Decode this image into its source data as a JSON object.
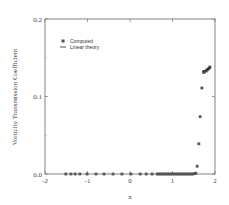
{
  "chart_data": {
    "type": "scatter",
    "title": "",
    "xlabel": "x",
    "ylabel": "Vorticity Transmission Coefficient",
    "xlim": [
      -2,
      2
    ],
    "ylim": [
      0.0,
      0.2
    ],
    "xticks": [
      -2,
      -1,
      0,
      1,
      2
    ],
    "xtick_labels": [
      "-2",
      "-1",
      "0",
      "1",
      "2"
    ],
    "yticks": [
      0.0,
      0.1,
      0.2
    ],
    "ytick_labels": [
      "0.0",
      "0.1",
      "0.2"
    ],
    "grid": false,
    "legend_position": "upper left",
    "series": [
      {
        "name": "Computed",
        "marker": "square",
        "color": "#555555",
        "x": [
          -1.51,
          -1.39,
          -1.29,
          -1.18,
          -1.01,
          -0.8,
          -0.61,
          -0.4,
          -0.19,
          0.02,
          0.24,
          0.38,
          0.52,
          0.64,
          0.68,
          0.72,
          0.76,
          0.8,
          0.84,
          0.88,
          0.92,
          0.96,
          1.0,
          1.04,
          1.08,
          1.12,
          1.16,
          1.2,
          1.24,
          1.28,
          1.32,
          1.36,
          1.4,
          1.44,
          1.48,
          1.52,
          1.55,
          1.58,
          1.62,
          1.65,
          1.69,
          1.73,
          1.76,
          1.79,
          1.81,
          1.83,
          1.85,
          1.87,
          1.88
        ],
        "y": [
          0,
          0,
          0,
          0,
          0,
          0,
          0,
          0,
          0,
          0,
          0,
          0,
          0,
          0,
          0,
          0,
          0,
          0,
          0,
          0,
          0,
          0,
          0,
          0,
          0,
          0,
          0,
          0,
          0,
          0,
          0,
          0,
          0,
          0,
          0,
          0.0005,
          0.001,
          0.01,
          0.039,
          0.074,
          0.111,
          0.131,
          0.132,
          0.133,
          0.134,
          0.135,
          0.136,
          0.137,
          0.138
        ]
      },
      {
        "name": "Linear theory",
        "marker": "line",
        "color": "#111111",
        "x": [
          1.7,
          1.75,
          1.8,
          1.85,
          1.9
        ],
        "y": [
          0.133,
          0.133,
          0.134,
          0.136,
          0.138
        ]
      }
    ]
  },
  "legend": {
    "items": [
      {
        "label": "Computed",
        "symbol": "square"
      },
      {
        "label": "Linear theory",
        "symbol": "line"
      }
    ]
  },
  "axes": {
    "xlabel": "x",
    "ylabel": "Vorticity Transmission Coefficient"
  }
}
